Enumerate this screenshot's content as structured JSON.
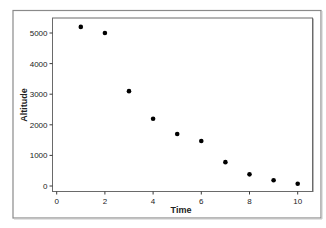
{
  "chart_data": {
    "type": "scatter",
    "title": "",
    "xlabel": "Time",
    "ylabel": "Altitude",
    "xlim": [
      -0.15,
      10.6
    ],
    "ylim": [
      -200,
      5500
    ],
    "x_ticks": [
      0,
      2,
      4,
      6,
      8,
      10
    ],
    "y_ticks": [
      0,
      1000,
      2000,
      3000,
      4000,
      5000
    ],
    "x_tick_labels": [
      "0",
      "2",
      "4",
      "6",
      "8",
      "10"
    ],
    "y_tick_labels": [
      "0",
      "1000",
      "2000",
      "3000",
      "4000",
      "5000"
    ],
    "grid": false,
    "legend": null,
    "series": [
      {
        "name": "Altitude",
        "marker": "circle",
        "color": "#000000",
        "x": [
          1,
          2,
          3,
          4,
          5,
          6,
          7,
          8,
          9,
          10
        ],
        "y": [
          5200,
          5000,
          3100,
          2200,
          1700,
          1470,
          780,
          380,
          190,
          75
        ]
      }
    ]
  },
  "style": {
    "frame_color": "#8a8a8a",
    "axis_color": "#3a3a3a",
    "text_color": "#222222",
    "point_color": "#000000"
  }
}
